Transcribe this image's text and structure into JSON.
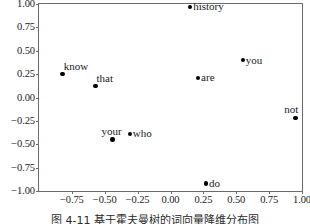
{
  "chart_data": {
    "type": "scatter",
    "title": "",
    "subtitle": "",
    "xlabel": "",
    "ylabel": "",
    "xlim": [
      -1.0,
      1.0
    ],
    "ylim": [
      -1.0,
      1.0
    ],
    "grid": false,
    "legend": null,
    "xticks": [
      "-0.75",
      "-0.50",
      "-0.25",
      "0.00",
      "0.25",
      "0.50",
      "0.75",
      "1.00"
    ],
    "xtick_values": [
      -0.75,
      -0.5,
      -0.25,
      0.0,
      0.25,
      0.5,
      0.75,
      1.0
    ],
    "yticks": [
      "1.00",
      "0.75",
      "0.50",
      "0.25",
      "0.00",
      "-0.25",
      "-0.50",
      "-0.75",
      "-1.00"
    ],
    "ytick_values": [
      1.0,
      0.75,
      0.5,
      0.25,
      0.0,
      -0.25,
      -0.5,
      -0.75,
      -1.0
    ],
    "marker_color": "#000000",
    "frame_color": "#6b6b6b",
    "points": [
      {
        "label": "history",
        "x": 0.15,
        "y": 0.97,
        "label_pos": "right"
      },
      {
        "label": "you",
        "x": 0.55,
        "y": 0.4,
        "label_pos": "right"
      },
      {
        "label": "are",
        "x": 0.21,
        "y": 0.21,
        "label_pos": "right"
      },
      {
        "label": "know",
        "x": -0.82,
        "y": 0.25,
        "label_pos": "upper-right"
      },
      {
        "label": "that",
        "x": -0.57,
        "y": 0.12,
        "label_pos": "upper-right"
      },
      {
        "label": "your",
        "x": -0.44,
        "y": -0.45,
        "label_pos": "above"
      },
      {
        "label": "who",
        "x": -0.31,
        "y": -0.39,
        "label_pos": "right"
      },
      {
        "label": "not",
        "x": 0.95,
        "y": -0.22,
        "label_pos": "above-left"
      },
      {
        "label": "do",
        "x": 0.27,
        "y": -0.92,
        "label_pos": "right"
      }
    ]
  },
  "caption": "图 4-11  基于霍夫曼树的词向量降维分布图"
}
